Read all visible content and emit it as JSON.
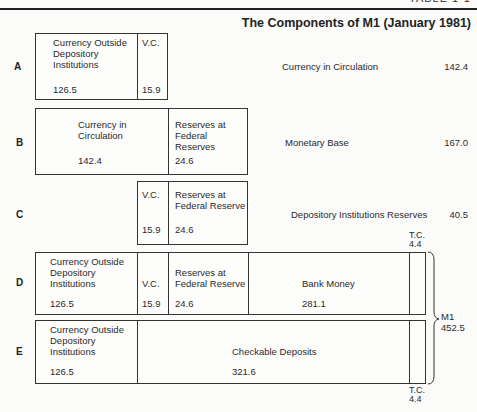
{
  "header": {
    "clipped_text": "TABLE 1-1",
    "title": "The Components of M1 (January 1981)"
  },
  "rows": {
    "A": {
      "label": "A",
      "cells": [
        {
          "name": "Currency Outside Depository Institutions",
          "lines": [
            "Currency Outside",
            "Depository",
            "Institutions"
          ],
          "value": "126.5"
        },
        {
          "name": "V.C.",
          "lines": [
            "V.C."
          ],
          "value": "15.9"
        }
      ],
      "total_label": "Currency in Circulation",
      "total_value": "142.4"
    },
    "B": {
      "label": "B",
      "cells": [
        {
          "name": "Currency in Circulation",
          "lines": [
            "Currency in",
            "Circulation"
          ],
          "value": "142.4"
        },
        {
          "name": "Reserves at Federal Reserves",
          "lines": [
            "Reserves at",
            "Federal Reserves"
          ],
          "value": "24.6"
        }
      ],
      "total_label": "Monetary Base",
      "total_value": "167.0"
    },
    "C": {
      "label": "C",
      "cells": [
        {
          "name": "V.C.",
          "lines": [
            "V.C."
          ],
          "value": "15.9"
        },
        {
          "name": "Reserves at Federal Reserve",
          "lines": [
            "Reserves at",
            "Federal Reserve"
          ],
          "value": "24.6"
        }
      ],
      "total_label": "Depository Institutions Reserves",
      "total_value": "40.5"
    },
    "D": {
      "label": "D",
      "cells": [
        {
          "name": "Currency Outside Depository Institutions",
          "lines": [
            "Currency Outside",
            "Depository",
            "Institutions"
          ],
          "value": "126.5"
        },
        {
          "name": "V.C.",
          "lines": [
            "V.C."
          ],
          "value": "15.9"
        },
        {
          "name": "Reserves at Federal Reserve",
          "lines": [
            "Reserves at",
            "Federal Reserve"
          ],
          "value": "24.6"
        },
        {
          "name": "Bank Money",
          "lines": [
            "Bank Money"
          ],
          "value": "281.1"
        },
        {
          "name": "T.C.",
          "lines": [
            ""
          ],
          "value": ""
        }
      ],
      "tc_label": "T.C.",
      "tc_value": "4.4"
    },
    "E": {
      "label": "E",
      "cells": [
        {
          "name": "Currency Outside Depository Institutions",
          "lines": [
            "Currency Outside",
            "Depository",
            "Institutions"
          ],
          "value": "126.5"
        },
        {
          "name": "Checkable Deposits",
          "lines": [
            "Checkable Deposits"
          ],
          "value": "321.6"
        },
        {
          "name": "T.C.",
          "lines": [
            ""
          ],
          "value": ""
        }
      ],
      "tc_label": "T.C.",
      "tc_value": "4.4"
    }
  },
  "bracket": {
    "label": "M1",
    "value": "452.5"
  }
}
